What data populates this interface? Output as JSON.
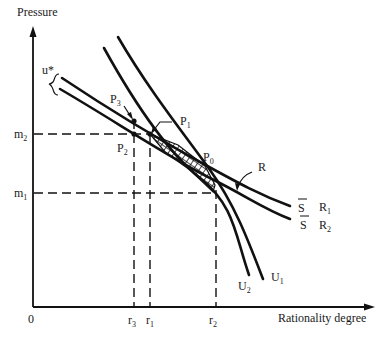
{
  "diagram": {
    "axes": {
      "y_label": "Pressure",
      "x_label": "Rationality degree",
      "origin": "0"
    },
    "y_ticks": [
      {
        "base": "m",
        "sub": "2"
      },
      {
        "base": "m",
        "sub": "1"
      }
    ],
    "x_ticks": [
      {
        "base": "r",
        "sub": "3"
      },
      {
        "base": "r",
        "sub": "1"
      },
      {
        "base": "r",
        "sub": "2"
      }
    ],
    "points": [
      {
        "base": "P",
        "sub": "0"
      },
      {
        "base": "P",
        "sub": "1"
      },
      {
        "base": "P",
        "sub": "2"
      },
      {
        "base": "P",
        "sub": "3"
      }
    ],
    "curves": {
      "u_star": "u*",
      "R": "R",
      "R1": {
        "base": "R",
        "sub": "1",
        "marker": "S"
      },
      "R2": {
        "base": "R",
        "sub": "2",
        "marker": "S"
      },
      "U1": {
        "base": "U",
        "sub": "1"
      },
      "U2": {
        "base": "U",
        "sub": "2"
      }
    },
    "colors": {
      "ink": "#111111",
      "background": "#ffffff"
    }
  }
}
